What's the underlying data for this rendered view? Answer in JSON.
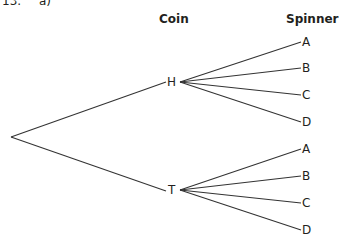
{
  "question": {
    "number": "13.",
    "part": "a)"
  },
  "headers": {
    "coin": "Coin",
    "spinner": "Spinner"
  },
  "tree": {
    "root": {
      "x": 11,
      "y": 137
    },
    "branches": [
      {
        "label": "H",
        "x": 172,
        "y": 82,
        "children": [
          {
            "label": "A",
            "y": 42
          },
          {
            "label": "B",
            "y": 68
          },
          {
            "label": "C",
            "y": 95
          },
          {
            "label": "D",
            "y": 122
          }
        ]
      },
      {
        "label": "T",
        "x": 173,
        "y": 190,
        "children": [
          {
            "label": "A",
            "y": 149
          },
          {
            "label": "B",
            "y": 176
          },
          {
            "label": "C",
            "y": 203
          },
          {
            "label": "D",
            "y": 230
          }
        ]
      }
    ]
  }
}
